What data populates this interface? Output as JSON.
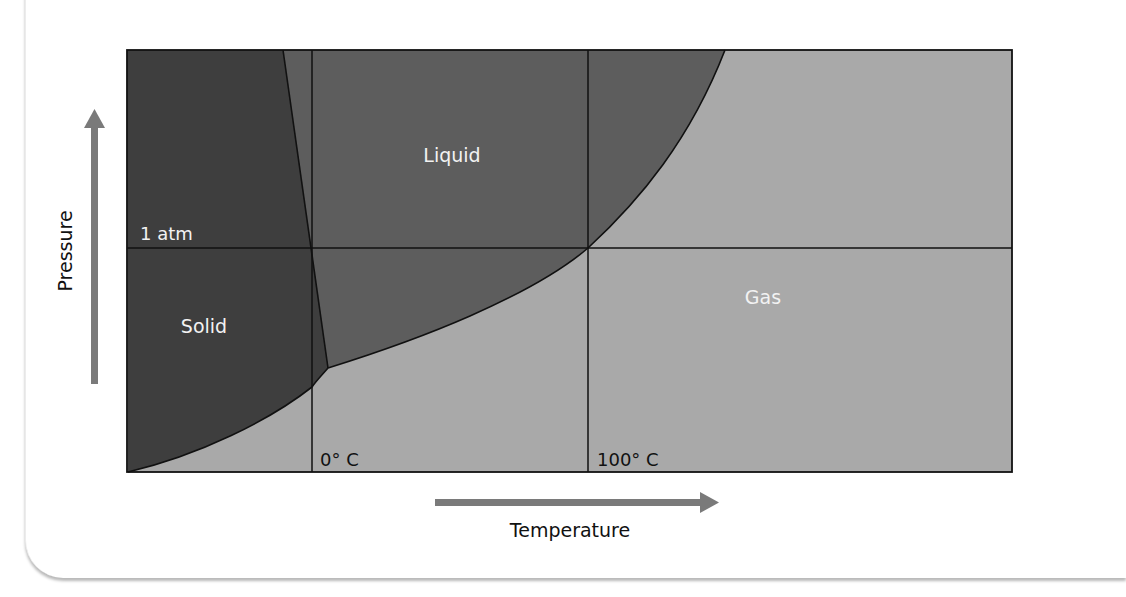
{
  "diagram": {
    "regions": {
      "solid": {
        "label": "Solid",
        "color": "#3e3e3e"
      },
      "liquid": {
        "label": "Liquid",
        "color": "#5d5d5d"
      },
      "gas": {
        "label": "Gas",
        "color": "#a9a9a9"
      }
    },
    "reference_lines": {
      "pressure_line_label": "1 atm",
      "freezing_label": "0° C",
      "boiling_label": "100° C"
    },
    "axes": {
      "x_label": "Temperature",
      "y_label": "Pressure",
      "arrow_color": "#7a7a7a"
    },
    "line_color": "#111111",
    "label_text_color_on_dark": "#f2f2f2",
    "label_text_color_on_light": "#111111"
  }
}
